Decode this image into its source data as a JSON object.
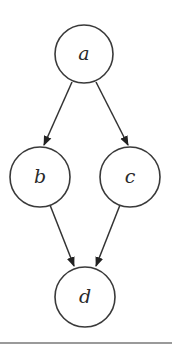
{
  "diagram": {
    "type": "directed-acyclic-graph",
    "nodes": [
      {
        "id": "a",
        "label": "a",
        "cx": 84,
        "cy": 54,
        "r": 29
      },
      {
        "id": "b",
        "label": "b",
        "cx": 40,
        "cy": 177,
        "r": 30
      },
      {
        "id": "c",
        "label": "c",
        "cx": 130,
        "cy": 177,
        "r": 30
      },
      {
        "id": "d",
        "label": "d",
        "cx": 85,
        "cy": 297,
        "r": 30
      }
    ],
    "edges": [
      {
        "from": "a",
        "to": "b"
      },
      {
        "from": "a",
        "to": "c"
      },
      {
        "from": "b",
        "to": "d"
      },
      {
        "from": "c",
        "to": "d"
      }
    ],
    "colors": {
      "stroke": "#3a3a3a",
      "background": "#ffffff",
      "bottom_rule": "#9a9a9a"
    }
  }
}
